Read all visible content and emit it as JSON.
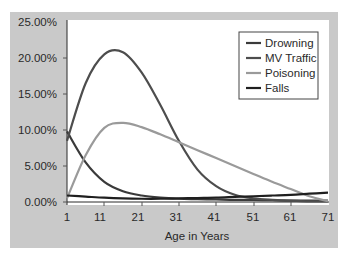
{
  "chart_data": {
    "type": "line",
    "title": "",
    "xlabel": "Age in Years",
    "ylabel": "",
    "x_ticks": [
      "1",
      "11",
      "21",
      "31",
      "41",
      "51",
      "61",
      "71"
    ],
    "y_ticks": [
      "0.00%",
      "5.00%",
      "10.00%",
      "15.00%",
      "20.00%",
      "25.00%"
    ],
    "xlim": [
      1,
      71
    ],
    "ylim": [
      0,
      25
    ],
    "grid": false,
    "legend_position": "top-right",
    "x": [
      1,
      6,
      11,
      16,
      21,
      26,
      31,
      36,
      41,
      46,
      51,
      56,
      61,
      66,
      71
    ],
    "series": [
      {
        "name": "Drowning",
        "color": "#3a3a3a",
        "values": [
          9.8,
          5.5,
          2.8,
          1.5,
          0.9,
          0.6,
          0.45,
          0.4,
          0.35,
          0.3,
          0.3,
          0.25,
          0.2,
          0.2,
          0.2
        ]
      },
      {
        "name": "MV Traffic",
        "color": "#4d4d4d",
        "values": [
          8.5,
          16.5,
          20.5,
          20.8,
          18.0,
          13.5,
          8.5,
          4.5,
          2.2,
          1.0,
          0.5,
          0.3,
          0.2,
          0.1,
          0.1
        ]
      },
      {
        "name": "Poisoning",
        "color": "#9a9a9a",
        "values": [
          0.5,
          6.5,
          10.3,
          11.0,
          10.4,
          9.4,
          8.3,
          7.2,
          6.1,
          5.0,
          3.9,
          2.8,
          1.8,
          0.8,
          0.1
        ]
      },
      {
        "name": "Falls",
        "color": "#1f1f1f",
        "values": [
          0.9,
          0.75,
          0.6,
          0.5,
          0.45,
          0.45,
          0.5,
          0.55,
          0.6,
          0.7,
          0.8,
          0.9,
          1.0,
          1.15,
          1.3
        ]
      }
    ]
  },
  "legend": {
    "items": [
      {
        "label": "Drowning",
        "color": "#3a3a3a"
      },
      {
        "label": "MV Traffic",
        "color": "#4d4d4d"
      },
      {
        "label": "Poisoning",
        "color": "#9a9a9a"
      },
      {
        "label": "Falls",
        "color": "#1f1f1f"
      }
    ]
  },
  "axes": {
    "xlabel": "Age in Years",
    "x_ticks": [
      "1",
      "11",
      "21",
      "31",
      "41",
      "51",
      "61",
      "71"
    ],
    "y_ticks": [
      "0.00%",
      "5.00%",
      "10.00%",
      "15.00%",
      "20.00%",
      "25.00%"
    ]
  },
  "colors": {
    "panel_bg": "#c9c9c9",
    "plot_bg": "#ffffff",
    "axis": "#2a2a2a"
  }
}
